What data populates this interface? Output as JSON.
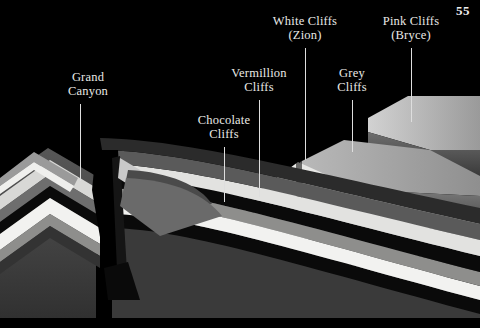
{
  "page": {
    "number": "55",
    "width": 480,
    "height": 328,
    "background": "#000000",
    "kind": "geological-block-diagram"
  },
  "palette": {
    "ink": "#000000",
    "label_text": "#e9e9e6",
    "leader_line": "#dedede",
    "terrace_top_bright": "#c9c9c9",
    "terrace_top_mid": "#a6a6a6",
    "terrace_face_dark": "#5c5c5c",
    "terrace_face_darker": "#3f3f3f",
    "strata_white": "#f2f2f0",
    "strata_light": "#c6c6c4",
    "strata_mid": "#8e8e8c",
    "strata_dark": "#4a4a4a",
    "strata_darkest": "#2b2b2b",
    "strata_black": "#0a0a0a"
  },
  "labels": [
    {
      "name": "grand-canyon",
      "lines": [
        "Grand",
        "Canyon"
      ],
      "x": 88,
      "y": 70,
      "leader": {
        "x": 80,
        "y1": 104,
        "y2": 181
      }
    },
    {
      "name": "chocolate-cliffs",
      "lines": [
        "Chocolate",
        "Cliffs"
      ],
      "x": 224,
      "y": 113,
      "leader": {
        "x": 224,
        "y1": 147,
        "y2": 202
      }
    },
    {
      "name": "vermillion-cliffs",
      "lines": [
        "Vermillion",
        "Cliffs"
      ],
      "x": 259,
      "y": 66,
      "leader": {
        "x": 259,
        "y1": 100,
        "y2": 197
      }
    },
    {
      "name": "white-cliffs-zion",
      "lines": [
        "White Cliffs",
        "(Zion)"
      ],
      "x": 305,
      "y": 14,
      "leader": {
        "x": 305,
        "y1": 48,
        "y2": 160
      }
    },
    {
      "name": "grey-cliffs",
      "lines": [
        "Grey",
        "Cliffs"
      ],
      "x": 352,
      "y": 66,
      "leader": {
        "x": 352,
        "y1": 100,
        "y2": 152
      }
    },
    {
      "name": "pink-cliffs-bryce",
      "lines": [
        "Pink Cliffs",
        "(Bryce)"
      ],
      "x": 411,
      "y": 14,
      "leader": {
        "x": 411,
        "y1": 48,
        "y2": 122
      }
    }
  ]
}
